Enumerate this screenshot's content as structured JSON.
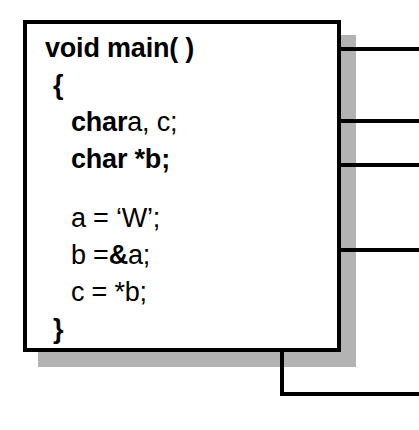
{
  "diagram": {
    "colors": {
      "line": "#000000",
      "box_fill": "#ffffff",
      "shadow": "#b3b3b3"
    }
  },
  "code_box": {
    "lines": [
      {
        "id": "line-void-main",
        "indent": 0,
        "segments": [
          {
            "text": "void main( )",
            "bold": true
          }
        ]
      },
      {
        "id": "line-open-brace",
        "indent": 1,
        "segments": [
          {
            "text": "{",
            "bold": true
          }
        ]
      },
      {
        "id": "line-char-a-c",
        "indent": 2,
        "segments": [
          {
            "text": "char",
            "bold": true
          },
          {
            "text": "a, c;",
            "bold": false
          }
        ]
      },
      {
        "id": "line-char-star-b",
        "indent": 2,
        "segments": [
          {
            "text": "char *b;",
            "bold": true
          }
        ]
      },
      {
        "id": "line-blank",
        "indent": 2,
        "blank": true,
        "segments": [
          {
            "text": "",
            "bold": false
          }
        ]
      },
      {
        "id": "line-a-assign-w",
        "indent": 2,
        "segments": [
          {
            "text": "a = ‘W’;",
            "bold": false
          }
        ]
      },
      {
        "id": "line-b-assign-amp-a",
        "indent": 2,
        "segments": [
          {
            "text": "b =",
            "bold": false
          },
          {
            "text": "&",
            "bold": true
          },
          {
            "text": "a;",
            "bold": false
          }
        ]
      },
      {
        "id": "line-c-assign-star-b",
        "indent": 2,
        "segments": [
          {
            "text": "c = *b;",
            "bold": false
          }
        ]
      },
      {
        "id": "line-close-brace",
        "indent": 1,
        "segments": [
          {
            "text": "}",
            "bold": true
          }
        ]
      }
    ]
  },
  "callouts": [
    {
      "id": "callout-char-a-c",
      "target_line": "char a, c;",
      "arrow_tip_x": 198,
      "arrow_y": 105,
      "riser_x": 238,
      "exit_y": 49,
      "exit_x": 419
    },
    {
      "id": "callout-char-star-b",
      "target_line": "char *b;",
      "arrow_tip_x": 193,
      "arrow_y": 147,
      "riser_x": 284,
      "exit_y": 121,
      "exit_x": 419
    },
    {
      "id": "callout-a-assign-w",
      "target_line": "a = 'W';",
      "arrow_tip_x": 193,
      "arrow_y": 208,
      "riser_x": 297,
      "exit_y": 165,
      "exit_x": 419
    },
    {
      "id": "callout-b-assign-amp",
      "target_line": "b =&a;",
      "arrow_tip_x": 193,
      "arrow_y": 250,
      "riser_x": 419,
      "exit_y": 250,
      "exit_x": 419
    },
    {
      "id": "callout-c-assign-star",
      "target_line": "c = *b;",
      "arrow_tip_x": 193,
      "arrow_y": 283,
      "riser_x": 282,
      "exit_y": 394,
      "exit_x": 419
    }
  ]
}
